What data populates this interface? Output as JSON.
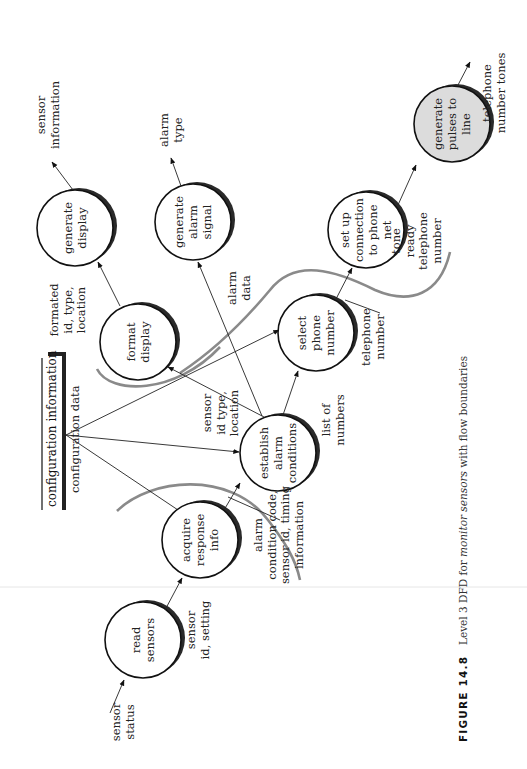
{
  "figure": {
    "number": "FIGURE 14.8",
    "caption_prefix": "Level 3 DFD for ",
    "caption_emphasis": "monitor sensors",
    "caption_suffix": " with flow boundaries"
  },
  "data_store": {
    "label": "configuration information",
    "outflow_label": "configuration data"
  },
  "processes": [
    {
      "id": "read_sensors",
      "lines": [
        "read",
        "sensors"
      ],
      "shaded": false
    },
    {
      "id": "acquire_response_info",
      "lines": [
        "acquire",
        "response",
        "info"
      ],
      "shaded": false
    },
    {
      "id": "establish_alarm_conditions",
      "lines": [
        "establish",
        "alarm",
        "conditions"
      ],
      "shaded": false
    },
    {
      "id": "format_display",
      "lines": [
        "format",
        "display"
      ],
      "shaded": false
    },
    {
      "id": "generate_display",
      "lines": [
        "generate",
        "display"
      ],
      "shaded": false
    },
    {
      "id": "generate_alarm_signal",
      "lines": [
        "generate",
        "alarm",
        "signal"
      ],
      "shaded": false
    },
    {
      "id": "select_phone_number",
      "lines": [
        "select",
        "phone",
        "number"
      ],
      "shaded": false
    },
    {
      "id": "set_up_connection",
      "lines": [
        "set up",
        "connection",
        "to phone",
        "net"
      ],
      "shaded": false
    },
    {
      "id": "generate_pulses",
      "lines": [
        "generate",
        "pulses to",
        "line"
      ],
      "shaded": true
    }
  ],
  "flows": {
    "sensor_status": [
      "sensor",
      "status"
    ],
    "sensor_id_setting": [
      "sensor",
      "id, setting"
    ],
    "alarm_condition": [
      "alarm",
      "condition code,",
      "sensor id, timing",
      "information"
    ],
    "sensor_id_type_location": [
      "sensor",
      "id type,",
      "location"
    ],
    "list_of_numbers": [
      "list of",
      "numbers"
    ],
    "alarm_data": [
      "alarm",
      "data"
    ],
    "formated_id": [
      "formated",
      "id, type,",
      "location"
    ],
    "sensor_information": [
      "sensor",
      "information"
    ],
    "alarm_type": [
      "alarm",
      "type"
    ],
    "telephone_number": [
      "telephone",
      "number"
    ],
    "tone_ready": [
      "tone",
      "ready",
      "telephone",
      "number"
    ],
    "telephone_number_tones": [
      "telephone",
      "number tones"
    ]
  },
  "colors": {
    "bubble_shadow": "#2a2a2a",
    "boundary": "#8a8a8a",
    "shaded_bubble": "#dcdcdc"
  }
}
